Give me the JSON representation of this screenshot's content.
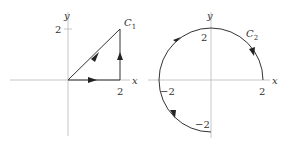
{
  "figure": {
    "left": {
      "curve_label": "C",
      "curve_subscript": "1",
      "x_axis_label": "x",
      "y_axis_label": "y",
      "x_tick": "2",
      "y_tick": "2",
      "description": "Closed triangular path (0,0) -> (2,0) -> (2,2) -> (0,0) with arrows indicating direction"
    },
    "right": {
      "curve_label": "C",
      "curve_subscript": "2",
      "x_axis_label": "x",
      "y_axis_label": "y",
      "x_tick_pos": "2",
      "x_tick_neg": "−2",
      "y_tick_pos": "2",
      "y_tick_neg": "−2",
      "description": "Three-quarter circle of radius 2 from (2,0) counterclockwise to (0,-2)"
    },
    "colors": {
      "curve": "#333333",
      "axis": "#b8b8b8"
    }
  }
}
